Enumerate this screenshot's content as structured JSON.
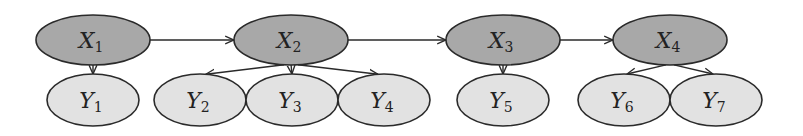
{
  "diagram": {
    "type": "hidden-markov-style graphical model",
    "colors": {
      "hidden_fill": "#a8a8a8",
      "observed_fill": "#e2e2e2",
      "stroke": "#2a2a2a"
    },
    "hidden_nodes": [
      {
        "id": "X1",
        "var": "X",
        "sub": "1",
        "cx": 93,
        "cy": 40,
        "rx": 57,
        "ry": 25
      },
      {
        "id": "X2",
        "var": "X",
        "sub": "2",
        "cx": 291,
        "cy": 40,
        "rx": 57,
        "ry": 25
      },
      {
        "id": "X3",
        "var": "X",
        "sub": "3",
        "cx": 503,
        "cy": 40,
        "rx": 57,
        "ry": 25
      },
      {
        "id": "X4",
        "var": "X",
        "sub": "4",
        "cx": 670,
        "cy": 40,
        "rx": 57,
        "ry": 25
      }
    ],
    "observed_nodes": [
      {
        "id": "Y1",
        "var": "Y",
        "sub": "1",
        "cx": 93,
        "cy": 100,
        "rx": 46,
        "ry": 26
      },
      {
        "id": "Y2",
        "var": "Y",
        "sub": "2",
        "cx": 200,
        "cy": 100,
        "rx": 46,
        "ry": 26
      },
      {
        "id": "Y3",
        "var": "Y",
        "sub": "3",
        "cx": 292,
        "cy": 100,
        "rx": 46,
        "ry": 26
      },
      {
        "id": "Y4",
        "var": "Y",
        "sub": "4",
        "cx": 384,
        "cy": 100,
        "rx": 46,
        "ry": 26
      },
      {
        "id": "Y5",
        "var": "Y",
        "sub": "5",
        "cx": 503,
        "cy": 100,
        "rx": 46,
        "ry": 26
      },
      {
        "id": "Y6",
        "var": "Y",
        "sub": "6",
        "cx": 624,
        "cy": 100,
        "rx": 46,
        "ry": 26
      },
      {
        "id": "Y7",
        "var": "Y",
        "sub": "7",
        "cx": 716,
        "cy": 100,
        "rx": 46,
        "ry": 26
      }
    ],
    "edges": [
      {
        "from": "X1",
        "to": "X2"
      },
      {
        "from": "X2",
        "to": "X3"
      },
      {
        "from": "X3",
        "to": "X4"
      },
      {
        "from": "X1",
        "to": "Y1"
      },
      {
        "from": "X2",
        "to": "Y2"
      },
      {
        "from": "X2",
        "to": "Y3"
      },
      {
        "from": "X2",
        "to": "Y4"
      },
      {
        "from": "X3",
        "to": "Y5"
      },
      {
        "from": "X4",
        "to": "Y6"
      },
      {
        "from": "X4",
        "to": "Y7"
      }
    ]
  }
}
